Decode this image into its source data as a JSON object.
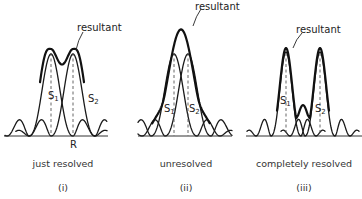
{
  "diagram": {
    "panels": [
      {
        "id": "i",
        "resultant_label": "resultant",
        "source1_label": "S",
        "source1_sub": "1",
        "source2_label": "S",
        "source2_sub": "2",
        "extra_label": "R",
        "caption": "just resolved",
        "number": "(i)",
        "separation": "just resolved"
      },
      {
        "id": "ii",
        "resultant_label": "resultant",
        "source1_label": "S",
        "source1_sub": "1",
        "source2_label": "S",
        "source2_sub": "2",
        "caption": "unresolved",
        "number": "(ii)",
        "separation": "unresolved"
      },
      {
        "id": "iii",
        "resultant_label": "resultant",
        "source1_label": "S",
        "source1_sub": "1",
        "source2_label": "S",
        "source2_sub": "2",
        "caption": "completely resolved",
        "number": "(iii)",
        "separation": "completely resolved"
      }
    ]
  }
}
